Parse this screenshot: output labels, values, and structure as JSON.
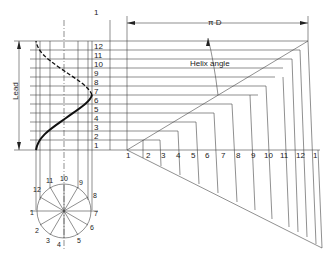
{
  "labels": {
    "circumference": "π D",
    "lead": "Lead",
    "helix_angle": "Helix angle"
  },
  "left_scale": [
    "1",
    "12",
    "11",
    "10",
    "9",
    "8",
    "7",
    "6",
    "5",
    "4",
    "3",
    "2",
    "1"
  ],
  "bottom_scale": [
    "1",
    "2",
    "3",
    "4",
    "5",
    "6",
    "7",
    "8",
    "9",
    "10",
    "11",
    "12",
    "1"
  ],
  "circle_points": [
    "1",
    "2",
    "3",
    "4",
    "5",
    "6",
    "7",
    "8",
    "9",
    "10",
    "11",
    "12"
  ],
  "colors": {
    "line": "#333333",
    "background": "#ffffff"
  }
}
